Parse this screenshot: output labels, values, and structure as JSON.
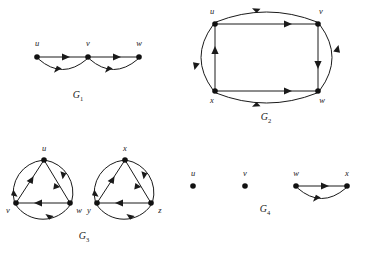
{
  "figure": {
    "background_color": "#ffffff",
    "ink_color": "#1a1a1a",
    "width": 367,
    "height": 253
  },
  "graphs": [
    {
      "id": "G1",
      "caption_letter": "G",
      "caption_sub": "1",
      "caption_x": 78,
      "caption_y": 98,
      "vertices": [
        {
          "name": "u",
          "label": "u",
          "x": 37,
          "y": 57,
          "label_x": 37,
          "label_y": 46
        },
        {
          "name": "v",
          "label": "v",
          "x": 88,
          "y": 57,
          "label_x": 88,
          "label_y": 46
        },
        {
          "name": "w",
          "label": "w",
          "x": 139,
          "y": 57,
          "label_x": 139,
          "label_y": 46
        }
      ],
      "edges": [
        {
          "from": "u",
          "to": "v",
          "style": "straight",
          "direction": "right"
        },
        {
          "from": "v",
          "to": "u",
          "style": "curved-below",
          "direction": "left"
        },
        {
          "from": "v",
          "to": "w",
          "style": "straight",
          "direction": "right"
        },
        {
          "from": "w",
          "to": "v",
          "style": "curved-below",
          "direction": "left"
        }
      ]
    },
    {
      "id": "G2",
      "caption_letter": "G",
      "caption_sub": "2",
      "caption_x": 266,
      "caption_y": 120,
      "vertices": [
        {
          "name": "u",
          "label": "u",
          "x": 215,
          "y": 24,
          "label_x": 212,
          "label_y": 14
        },
        {
          "name": "v",
          "label": "v",
          "x": 318,
          "y": 24,
          "label_x": 321,
          "label_y": 14
        },
        {
          "name": "x",
          "label": "x",
          "x": 215,
          "y": 91,
          "label_x": 212,
          "label_y": 102
        },
        {
          "name": "w",
          "label": "w",
          "x": 318,
          "y": 91,
          "label_x": 321,
          "label_y": 102
        }
      ],
      "edges": [
        {
          "from": "u",
          "to": "v",
          "style": "straight",
          "direction": "right"
        },
        {
          "from": "v",
          "to": "u",
          "style": "curved-above",
          "direction": "left"
        },
        {
          "from": "x",
          "to": "w",
          "style": "straight",
          "direction": "right"
        },
        {
          "from": "w",
          "to": "x",
          "style": "curved-below",
          "direction": "left"
        },
        {
          "from": "x",
          "to": "u",
          "style": "straight",
          "direction": "up"
        },
        {
          "from": "u",
          "to": "x",
          "style": "curved-left",
          "direction": "down"
        },
        {
          "from": "v",
          "to": "w",
          "style": "straight",
          "direction": "down"
        },
        {
          "from": "w",
          "to": "v",
          "style": "curved-right",
          "direction": "up"
        }
      ]
    },
    {
      "id": "G3",
      "caption_letter": "G",
      "caption_sub": "3",
      "caption_x": 84,
      "caption_y": 239,
      "components": [
        {
          "name": "left-triangle",
          "center_x": 44,
          "center_y": 186,
          "radius": 33,
          "vertices": [
            {
              "name": "u",
              "label": "u",
              "x": 44,
              "y": 160,
              "label_x": 44,
              "label_y": 150
            },
            {
              "name": "v",
              "label": "v",
              "x": 16,
              "y": 203,
              "label_x": 9,
              "label_y": 212
            },
            {
              "name": "w",
              "label": "w",
              "x": 70,
              "y": 203,
              "label_x": 78,
              "label_y": 212
            }
          ],
          "edges": [
            {
              "from": "v",
              "to": "u",
              "style": "chord"
            },
            {
              "from": "u",
              "to": "w",
              "style": "chord"
            },
            {
              "from": "w",
              "to": "v",
              "style": "chord"
            },
            {
              "from": "u",
              "to": "v",
              "style": "arc"
            },
            {
              "from": "v",
              "to": "w",
              "style": "arc"
            },
            {
              "from": "w",
              "to": "u",
              "style": "arc"
            }
          ]
        },
        {
          "name": "right-triangle",
          "center_x": 125,
          "center_y": 186,
          "radius": 33,
          "vertices": [
            {
              "name": "x",
              "label": "x",
              "x": 125,
              "y": 160,
              "label_x": 125,
              "label_y": 150
            },
            {
              "name": "y",
              "label": "y",
              "x": 97,
              "y": 203,
              "label_x": 90,
              "label_y": 212
            },
            {
              "name": "z",
              "label": "z",
              "x": 151,
              "y": 203,
              "label_x": 159,
              "label_y": 212
            }
          ],
          "edges": [
            {
              "from": "y",
              "to": "x",
              "style": "chord"
            },
            {
              "from": "x",
              "to": "z",
              "style": "chord"
            },
            {
              "from": "z",
              "to": "y",
              "style": "chord"
            },
            {
              "from": "x",
              "to": "y",
              "style": "arc"
            },
            {
              "from": "y",
              "to": "z",
              "style": "arc"
            },
            {
              "from": "z",
              "to": "x",
              "style": "arc"
            }
          ]
        }
      ]
    },
    {
      "id": "G4",
      "caption_letter": "G",
      "caption_sub": "4",
      "caption_x": 265,
      "caption_y": 212,
      "vertices": [
        {
          "name": "u",
          "label": "u",
          "x": 193,
          "y": 186,
          "label_x": 193,
          "label_y": 176,
          "isolated": true
        },
        {
          "name": "v",
          "label": "v",
          "x": 245,
          "y": 186,
          "label_x": 245,
          "label_y": 176,
          "isolated": true
        },
        {
          "name": "w",
          "label": "w",
          "x": 296,
          "y": 186,
          "label_x": 296,
          "label_y": 176,
          "isolated": false
        },
        {
          "name": "x",
          "label": "x",
          "x": 347,
          "y": 186,
          "label_x": 347,
          "label_y": 176,
          "isolated": false
        }
      ],
      "edges": [
        {
          "from": "w",
          "to": "x",
          "style": "straight",
          "direction": "right"
        },
        {
          "from": "x",
          "to": "w",
          "style": "curved-below",
          "direction": "left"
        }
      ]
    }
  ]
}
